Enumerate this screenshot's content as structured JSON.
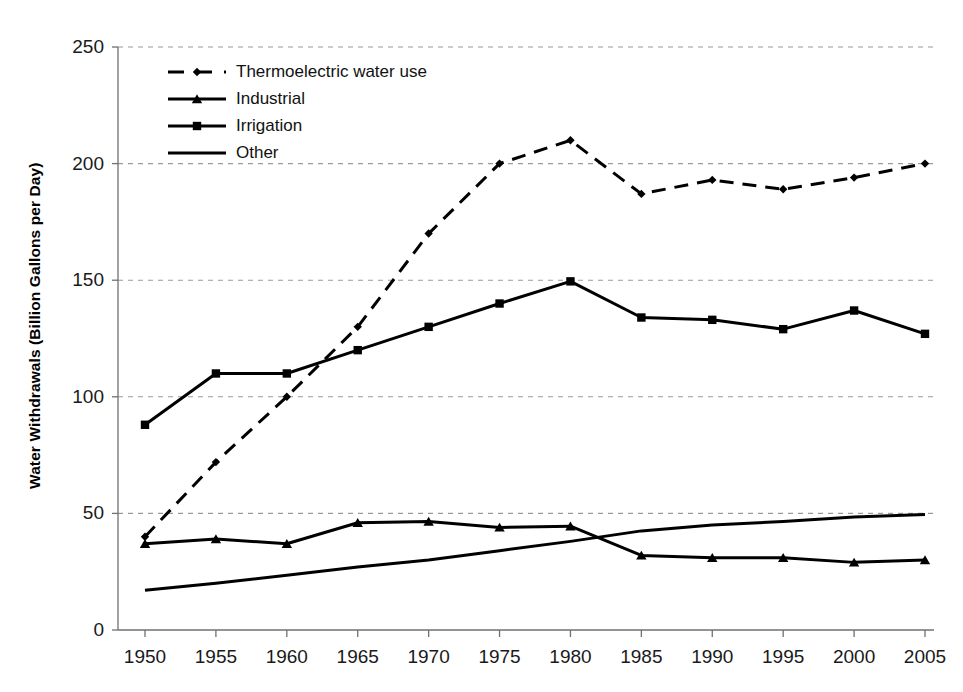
{
  "chart_data": {
    "type": "line",
    "title": "",
    "xlabel": "",
    "ylabel": "Water Withdrawals (Billion Gallons per Day)",
    "categories": [
      1950,
      1955,
      1960,
      1965,
      1970,
      1975,
      1980,
      1985,
      1990,
      1995,
      2000,
      2005
    ],
    "x_tick_labels": [
      "1950",
      "1955",
      "1960",
      "1965",
      "1970",
      "1975",
      "1980",
      "1985",
      "1990",
      "1995",
      "2000",
      "2005"
    ],
    "y_tick_labels": [
      "0",
      "50",
      "100",
      "150",
      "200",
      "250"
    ],
    "y_ticks": [
      0,
      50,
      100,
      150,
      200,
      250
    ],
    "xlim": [
      1950,
      2005
    ],
    "ylim": [
      0,
      250
    ],
    "grid": "horizontal-dashed",
    "legend_position": "top-left-inside",
    "series": [
      {
        "name": "Thermoelectric water use",
        "values": [
          40,
          72,
          100,
          130,
          170,
          200,
          210,
          187,
          193,
          189,
          194,
          200
        ],
        "style": "dashed",
        "marker": "diamond",
        "color": "#000000"
      },
      {
        "name": "Industrial",
        "values": [
          37,
          39,
          37,
          46,
          46.5,
          44,
          44.5,
          32,
          31,
          31,
          29,
          30
        ],
        "style": "solid",
        "marker": "triangle",
        "color": "#000000"
      },
      {
        "name": "Irrigation",
        "values": [
          88,
          110,
          110,
          120,
          130,
          140,
          149.5,
          134,
          133,
          129,
          137,
          127
        ],
        "style": "solid",
        "marker": "square",
        "color": "#000000"
      },
      {
        "name": "Other",
        "values": [
          17,
          20,
          23.5,
          27,
          30,
          34,
          38,
          42.5,
          45,
          46.5,
          48.5,
          49.5
        ],
        "style": "solid",
        "marker": "none",
        "color": "#000000"
      }
    ]
  },
  "legend": {
    "items": [
      {
        "label": "Thermoelectric water use",
        "marker": "diamond",
        "dash": true
      },
      {
        "label": "Industrial",
        "marker": "triangle",
        "dash": false
      },
      {
        "label": "Irrigation",
        "marker": "square",
        "dash": false
      },
      {
        "label": "Other",
        "marker": "none",
        "dash": false
      }
    ]
  },
  "colors": {
    "line": "#000000",
    "grid": "#9a9a9a",
    "axis": "#707070",
    "background": "#ffffff"
  }
}
